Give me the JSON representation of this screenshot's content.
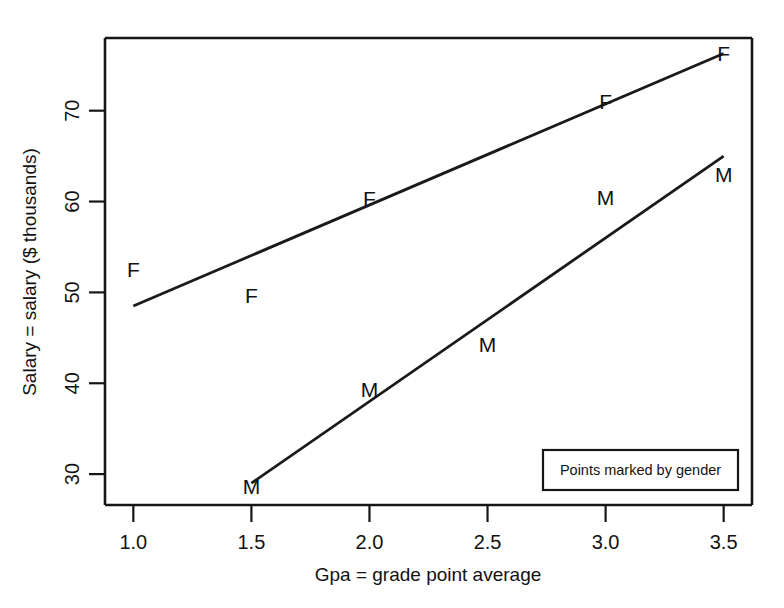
{
  "chart_data": {
    "type": "scatter",
    "title": "",
    "subtitle": "",
    "xlabel": "Gpa = grade point average",
    "ylabel": "Salary = salary ($ thousands)",
    "xlim": [
      0.88,
      3.62
    ],
    "ylim": [
      26.6,
      78.0
    ],
    "grid": false,
    "xticks": [
      1.0,
      1.5,
      2.0,
      2.5,
      3.0,
      3.5
    ],
    "xticklabels": [
      "1.0",
      "1.5",
      "2.0",
      "2.5",
      "3.0",
      "3.5"
    ],
    "yticks": [
      30,
      40,
      50,
      60,
      70
    ],
    "yticklabels": [
      "30",
      "40",
      "50",
      "60",
      "70"
    ],
    "marker_style": "text-letter",
    "annotation": "Points marked by gender",
    "legend_position": "bottom-right",
    "series": [
      {
        "name": "F",
        "marker": "F",
        "points": [
          {
            "x": 1.0,
            "y": 52.5
          },
          {
            "x": 1.5,
            "y": 49.7
          },
          {
            "x": 2.0,
            "y": 60.3
          },
          {
            "x": 3.0,
            "y": 71.0
          },
          {
            "x": 3.5,
            "y": 76.3
          }
        ],
        "fit_line": {
          "x0": 1.0,
          "y0": 48.5,
          "x1": 3.5,
          "y1": 76.3
        }
      },
      {
        "name": "M",
        "marker": "M",
        "points": [
          {
            "x": 1.5,
            "y": 28.6
          },
          {
            "x": 2.0,
            "y": 39.3
          },
          {
            "x": 2.5,
            "y": 44.3
          },
          {
            "x": 3.0,
            "y": 60.4
          },
          {
            "x": 3.5,
            "y": 63.0
          }
        ],
        "fit_line": {
          "x0": 1.5,
          "y0": 29.0,
          "x1": 3.5,
          "y1": 65.0
        }
      }
    ]
  },
  "legend": {
    "text": "Points marked by gender"
  },
  "axes": {
    "x_title": "Gpa = grade point average",
    "y_title": "Salary = salary ($ thousands)"
  }
}
